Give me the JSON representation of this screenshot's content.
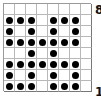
{
  "board": {
    "columns": 8,
    "rows": 8,
    "dot_color": "#000000",
    "grid_color": "#b8b8b8",
    "cells": [
      [
        0,
        0,
        0,
        0,
        0,
        0,
        0,
        0
      ],
      [
        1,
        1,
        1,
        0,
        1,
        1,
        1,
        0
      ],
      [
        1,
        0,
        1,
        0,
        1,
        0,
        1,
        0
      ],
      [
        1,
        1,
        1,
        1,
        1,
        1,
        1,
        0
      ],
      [
        0,
        0,
        1,
        0,
        1,
        0,
        0,
        0
      ],
      [
        1,
        1,
        1,
        1,
        1,
        1,
        1,
        0
      ],
      [
        1,
        0,
        1,
        0,
        1,
        0,
        1,
        0
      ],
      [
        1,
        1,
        1,
        0,
        1,
        1,
        1,
        0
      ]
    ]
  },
  "labels": {
    "top_rank": "8",
    "bottom_rank": "1"
  }
}
